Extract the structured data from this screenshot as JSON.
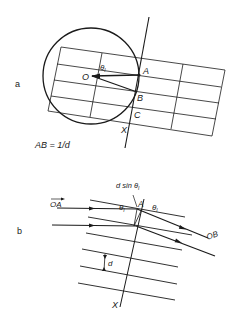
{
  "figure": {
    "panel_a": {
      "label": "a",
      "points": {
        "O": "O",
        "A": "A",
        "B": "B",
        "C": "C",
        "X": "X"
      },
      "angle_label": "θ",
      "angle_sub": "I",
      "equation": "AB = 1/d"
    },
    "panel_b": {
      "label": "b",
      "point_A": "A",
      "vector_in": "OA",
      "vector_out": "OB",
      "path_diff": "d sin θ",
      "path_diff_sub": "I",
      "angle_in": "θ",
      "angle_in_sub": "I",
      "angle_out": "θ",
      "angle_out_sub": "I",
      "spacing": "d",
      "axis": "X"
    }
  }
}
